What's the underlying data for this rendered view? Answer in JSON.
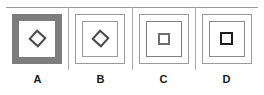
{
  "figure": {
    "type": "multi-panel-shape-diagram",
    "panel_count": 4,
    "divider_color": "#a8a8a8",
    "rule_color": "#9a9a9a",
    "panels": [
      {
        "label": "A",
        "outer_frame": "thick-gray-band-square",
        "outer_frame_color": "#7d7d7d",
        "inner_shape": "diamond",
        "inner_shape_color": "#4a4a4a"
      },
      {
        "label": "B",
        "outer_frame": "thin-double-line-square",
        "outer_frame_color": "#9a9a9a",
        "inner_shape": "diamond",
        "inner_shape_color": "#4a4a4a"
      },
      {
        "label": "C",
        "outer_frame": "thin-double-line-square",
        "outer_frame_color": "#9a9a9a",
        "inner_shape": "square",
        "inner_shape_color": "#6e6e6e"
      },
      {
        "label": "D",
        "outer_frame": "thin-double-line-square",
        "outer_frame_color": "#9a9a9a",
        "inner_shape": "square-bold",
        "inner_shape_color": "#1d1d1d"
      }
    ]
  }
}
